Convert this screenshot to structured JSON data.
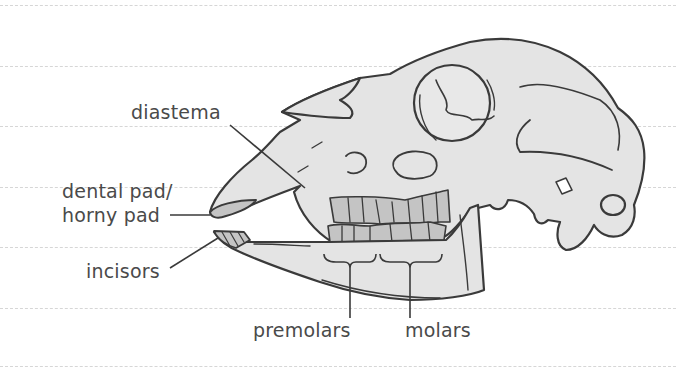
{
  "diagram": {
    "labels": {
      "diastema": "diastema",
      "dental_pad_line1": "dental pad/",
      "dental_pad_line2": "horny pad",
      "incisors": "incisors",
      "premolars": "premolars",
      "molars": "molars"
    },
    "colors": {
      "outline": "#3a3a3a",
      "bone_fill": "#e4e4e4",
      "teeth_fill": "#c4c4c4",
      "label_text": "#4a4a4a",
      "rule_lines": "#d6d6d6"
    }
  }
}
